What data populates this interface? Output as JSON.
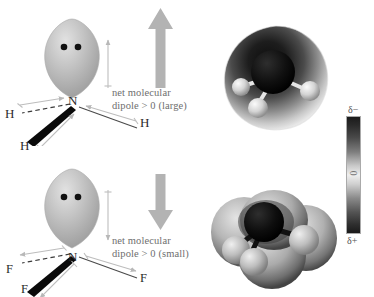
{
  "figure": {
    "title_visible": false,
    "background": "#ffffff"
  },
  "rows": [
    {
      "id": "ammonia",
      "molecule": "NH3",
      "central_atom": "N",
      "terminal_atoms": [
        "H",
        "H",
        "H"
      ],
      "lone_pair_dots": 2,
      "net_dipole_arrow": "up",
      "caption_line1": "net molecular",
      "caption_line2": "dipole > 0 (large)"
    },
    {
      "id": "nitrogen-trifluoride",
      "molecule": "NF3",
      "central_atom": "N",
      "terminal_atoms": [
        "F",
        "F",
        "F"
      ],
      "lone_pair_dots": 2,
      "net_dipole_arrow": "down",
      "caption_line1": "net molecular",
      "caption_line2": "dipole > 0 (small)"
    }
  ],
  "scale": {
    "top_label": "δ−",
    "middle_label": "0",
    "bottom_label": "δ+",
    "top_color": "#1b1b1b",
    "middle_color": "#efefef",
    "bottom_color": "#1a1a1a"
  },
  "colors": {
    "arrow_gray": "#b3b3b3",
    "lobe_gray": "#b8b8b8",
    "text_gray": "#6e6e6e",
    "atom_black": "#2b2b2b",
    "bond_gray": "#555555"
  }
}
